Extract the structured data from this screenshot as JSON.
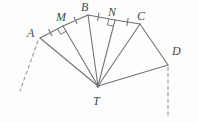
{
  "figure": {
    "type": "geometry-diagram",
    "background_color": "#fdfdfd",
    "stroke_color": "#6e7076",
    "label_color": "#4a4a4a",
    "vertices": [
      {
        "id": "A",
        "label": "A",
        "x": 40,
        "y": 38,
        "label_x": 27,
        "label_y": 27
      },
      {
        "id": "M",
        "label": "M",
        "x": 63,
        "y": 26,
        "label_x": 56,
        "label_y": 11
      },
      {
        "id": "B",
        "label": "B",
        "x": 88,
        "y": 15,
        "label_x": 81,
        "label_y": 1
      },
      {
        "id": "N",
        "label": "N",
        "x": 115,
        "y": 20,
        "label_x": 108,
        "label_y": 6
      },
      {
        "id": "C",
        "label": "C",
        "x": 140,
        "y": 24,
        "label_x": 137,
        "label_y": 10
      },
      {
        "id": "D",
        "label": "D",
        "x": 168,
        "y": 65,
        "label_x": 172,
        "label_y": 45
      },
      {
        "id": "T",
        "label": "T",
        "x": 98,
        "y": 86,
        "label_x": 93,
        "label_y": 95
      }
    ],
    "solid_segments": [
      {
        "name": "segment-A-M",
        "from": "A",
        "to": "M"
      },
      {
        "name": "segment-M-B",
        "from": "M",
        "to": "B"
      },
      {
        "name": "segment-B-N",
        "from": "B",
        "to": "N"
      },
      {
        "name": "segment-N-C",
        "from": "N",
        "to": "C"
      },
      {
        "name": "segment-C-D",
        "from": "C",
        "to": "D"
      },
      {
        "name": "segment-A-T",
        "from": "A",
        "to": "T"
      },
      {
        "name": "segment-M-T",
        "from": "M",
        "to": "T"
      },
      {
        "name": "segment-B-T",
        "from": "B",
        "to": "T"
      },
      {
        "name": "segment-N-T",
        "from": "N",
        "to": "T"
      },
      {
        "name": "segment-C-T",
        "from": "C",
        "to": "T"
      },
      {
        "name": "segment-T-D",
        "from": "T",
        "to": "D"
      }
    ],
    "dashed_rays": [
      {
        "name": "dashed-ray-at-A",
        "x1": 38,
        "y1": 41,
        "x2": 20,
        "y2": 91
      },
      {
        "name": "dashed-ray-at-D",
        "x1": 168,
        "y1": 67,
        "x2": 168,
        "y2": 117
      }
    ],
    "right_angle_marks": [
      {
        "name": "right-angle-mark-M",
        "vertex": "M",
        "x": 63,
        "y": 26
      },
      {
        "name": "right-angle-mark-N",
        "vertex": "N",
        "x": 115,
        "y": 20
      }
    ],
    "tick_marks": [
      {
        "name": "tick-segment-A-M",
        "on": "segment-A-M",
        "t": 0.45
      },
      {
        "name": "tick-segment-M-B",
        "on": "segment-M-B",
        "t": 0.5
      },
      {
        "name": "tick-segment-B-N",
        "on": "segment-B-N",
        "t": 0.38
      },
      {
        "name": "tick-segment-N-C",
        "on": "segment-N-C",
        "t": 0.5
      }
    ]
  }
}
